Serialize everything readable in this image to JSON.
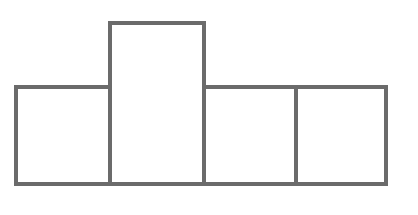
{
  "diagram": {
    "type": "block-outline",
    "stroke_color": "#6b6b6b",
    "background": "#ffffff",
    "stroke_width": 4,
    "boxes": [
      {
        "id": "box-1",
        "x": 14,
        "y": 85,
        "width": 98,
        "height": 101
      },
      {
        "id": "box-2",
        "x": 108,
        "y": 21,
        "width": 98,
        "height": 165
      },
      {
        "id": "box-3",
        "x": 202,
        "y": 85,
        "width": 96,
        "height": 101
      },
      {
        "id": "box-4",
        "x": 294,
        "y": 85,
        "width": 94,
        "height": 101
      }
    ]
  }
}
